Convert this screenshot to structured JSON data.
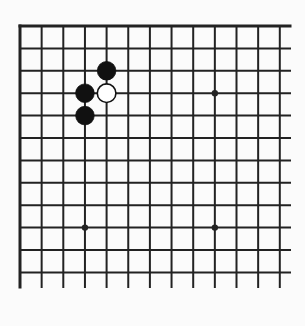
{
  "board": {
    "type": "go",
    "visible_columns": 13,
    "visible_rows": 12,
    "origin_x": 20,
    "origin_y": 26,
    "spacing_x": 21.65,
    "spacing_y": 22.4,
    "extend_right_to": 290,
    "extend_bottom_to": 287,
    "edges": {
      "top": true,
      "left": true,
      "right": false,
      "bottom": false
    },
    "line_color": "#222222",
    "background_color": "#fbfbfb",
    "star_points": [
      {
        "col": 3,
        "row": 3
      },
      {
        "col": 9,
        "row": 3
      },
      {
        "col": 3,
        "row": 9
      },
      {
        "col": 9,
        "row": 9
      }
    ],
    "stones": [
      {
        "color": "black",
        "col": 4,
        "row": 2
      },
      {
        "color": "black",
        "col": 3,
        "row": 3
      },
      {
        "color": "white",
        "col": 4,
        "row": 3
      },
      {
        "color": "black",
        "col": 3,
        "row": 4
      }
    ]
  }
}
